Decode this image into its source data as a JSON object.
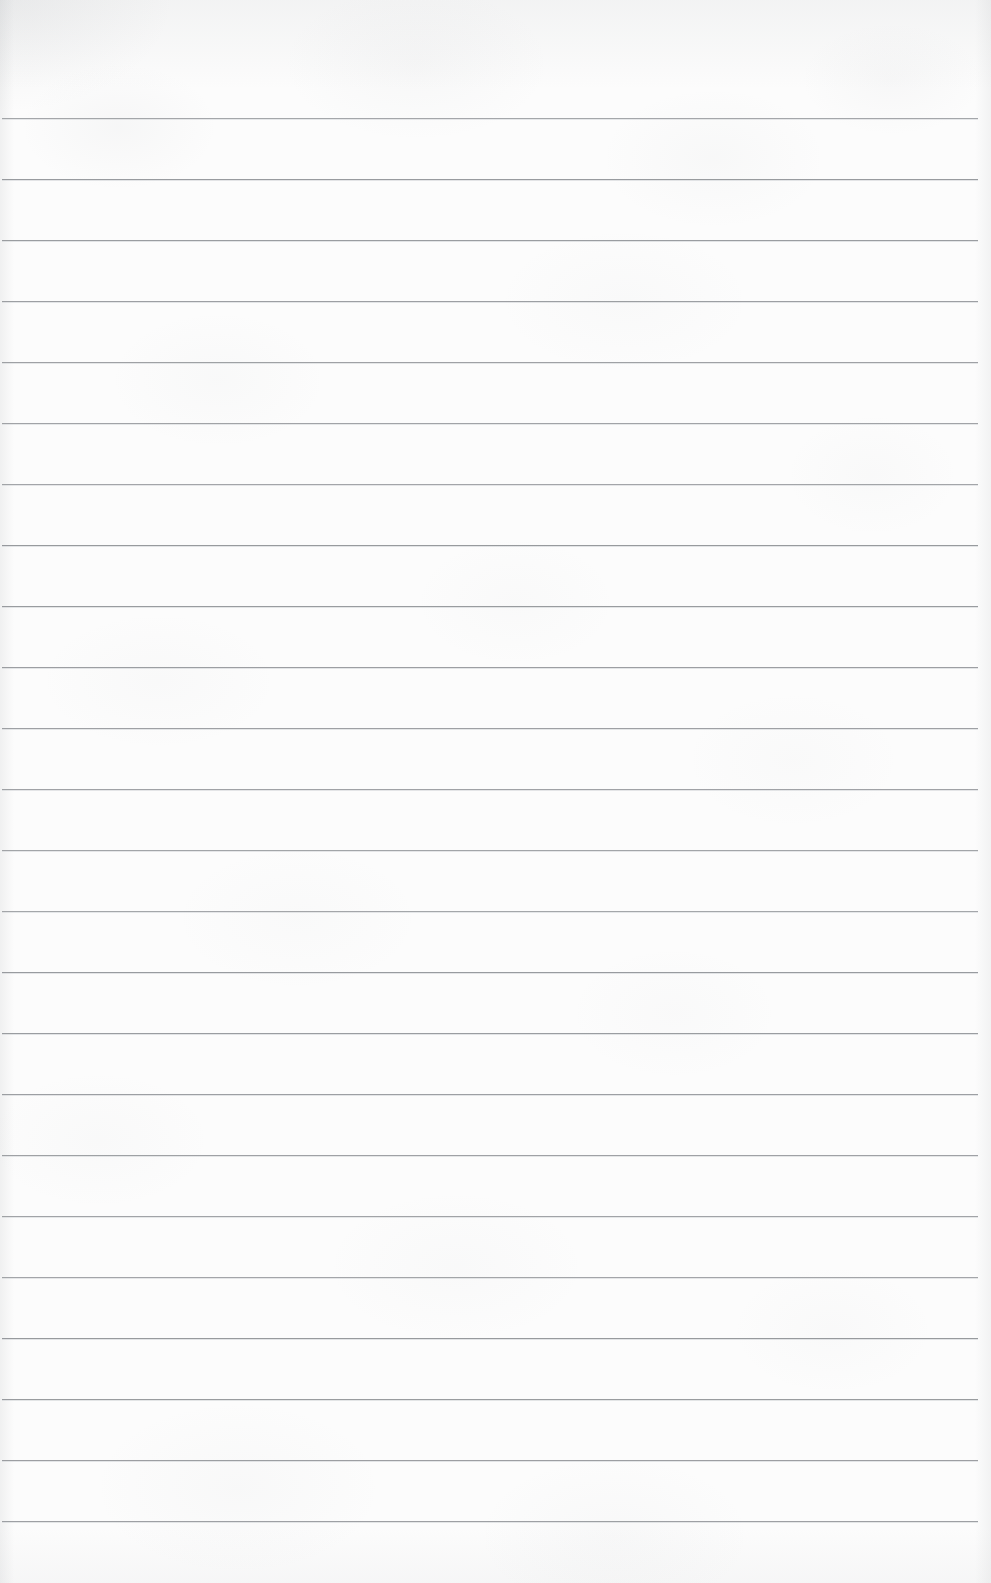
{
  "page": {
    "kind": "blank-ruled-paper",
    "width_px": 991,
    "height_px": 1583,
    "paper_color": "#fcfcfc",
    "rule_color": "#8f9296",
    "content_text": ""
  },
  "rules": {
    "count": 24,
    "first_line_y": 118,
    "spacing_px": 61,
    "line_start_x": 2,
    "line_end_x": 978,
    "thickness_px": 1,
    "top_margin_px": 118,
    "bottom_margin_px": 60,
    "y_positions": [
      118,
      179,
      240,
      301,
      362,
      423,
      484,
      545,
      606,
      667,
      728,
      789,
      850,
      911,
      972,
      1033,
      1094,
      1155,
      1216,
      1277,
      1338,
      1399,
      1460,
      1521
    ]
  }
}
